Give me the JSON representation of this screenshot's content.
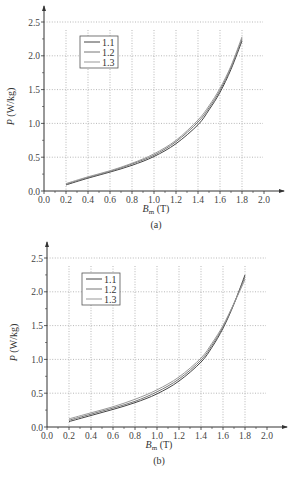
{
  "chart_data": [
    {
      "type": "line",
      "caption": "(a)",
      "xlabel": "B_m (T)",
      "xlabel_main": "B",
      "xlabel_sub": "m",
      "xlabel_unit": "(T)",
      "ylabel": "P (W/kg)",
      "ylabel_main": "P",
      "ylabel_unit": "(W/kg)",
      "xlim": [
        0.0,
        2.0
      ],
      "ylim": [
        0.0,
        2.5
      ],
      "xticks": [
        "0.0",
        "0.2",
        "0.4",
        "0.6",
        "0.8",
        "1.0",
        "1.2",
        "1.4",
        "1.6",
        "1.8",
        "2.0"
      ],
      "yticks": [
        "0.0",
        "0.5",
        "1.0",
        "1.5",
        "2.0",
        "2.5"
      ],
      "grid": true,
      "legend_position": "top-left",
      "x": [
        0.2,
        0.4,
        0.6,
        0.8,
        1.0,
        1.2,
        1.4,
        1.5,
        1.6,
        1.7,
        1.8
      ],
      "series": [
        {
          "name": "1.1",
          "color": "#444444",
          "values": [
            0.09,
            0.19,
            0.28,
            0.38,
            0.51,
            0.7,
            0.98,
            1.2,
            1.46,
            1.8,
            2.22
          ]
        },
        {
          "name": "1.2",
          "color": "#777777",
          "values": [
            0.1,
            0.2,
            0.29,
            0.4,
            0.53,
            0.73,
            1.02,
            1.23,
            1.49,
            1.83,
            2.25
          ]
        },
        {
          "name": "1.3",
          "color": "#999999",
          "values": [
            0.11,
            0.21,
            0.3,
            0.41,
            0.55,
            0.75,
            1.05,
            1.26,
            1.52,
            1.85,
            2.28
          ]
        }
      ]
    },
    {
      "type": "line",
      "caption": "(b)",
      "xlabel": "B_m (T)",
      "xlabel_main": "B",
      "xlabel_sub": "m",
      "xlabel_unit": "(T)",
      "ylabel": "P (W/kg)",
      "ylabel_main": "P",
      "ylabel_unit": "(W/kg)",
      "xlim": [
        0.0,
        2.0
      ],
      "ylim": [
        0.0,
        2.5
      ],
      "xticks": [
        "0.0",
        "0.2",
        "0.4",
        "0.6",
        "0.8",
        "1.0",
        "1.2",
        "1.4",
        "1.6",
        "1.8",
        "2.0"
      ],
      "yticks": [
        "0.0",
        "0.5",
        "1.0",
        "1.5",
        "2.0",
        "2.5"
      ],
      "grid": true,
      "legend_position": "top-left",
      "x": [
        0.2,
        0.4,
        0.6,
        0.8,
        1.0,
        1.2,
        1.4,
        1.5,
        1.6,
        1.7,
        1.8
      ],
      "series": [
        {
          "name": "1.1",
          "color": "#444444",
          "values": [
            0.08,
            0.17,
            0.26,
            0.36,
            0.49,
            0.68,
            0.96,
            1.18,
            1.46,
            1.82,
            2.25
          ]
        },
        {
          "name": "1.2",
          "color": "#777777",
          "values": [
            0.1,
            0.19,
            0.28,
            0.38,
            0.52,
            0.71,
            0.99,
            1.21,
            1.48,
            1.83,
            2.22
          ]
        },
        {
          "name": "1.3",
          "color": "#999999",
          "values": [
            0.12,
            0.21,
            0.3,
            0.41,
            0.55,
            0.74,
            1.02,
            1.24,
            1.5,
            1.83,
            2.18
          ]
        }
      ]
    }
  ]
}
